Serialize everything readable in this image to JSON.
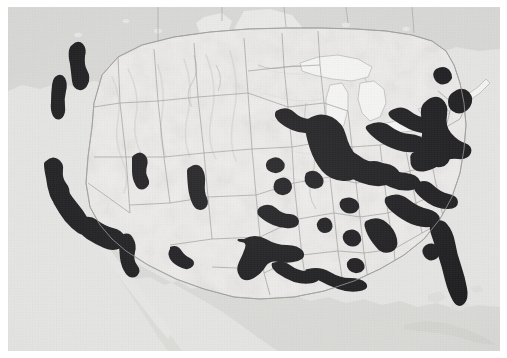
{
  "document": {
    "kind": "scanned-map-figure",
    "subject": "United States megaregions / urbanized corridors",
    "title_visible": "",
    "caption_visible": "",
    "legend_visible": "",
    "has_text_labels": false,
    "orientation": "landscape",
    "projection_appearance": "conic (Albers-like), curved parallels"
  },
  "canvas": {
    "width_px": 507,
    "height_px": 358,
    "paper_margin_px": 8,
    "map_left_px": 8,
    "map_top_px": 7,
    "map_width_px": 492,
    "map_height_px": 344
  },
  "palette": {
    "paper_white": "#ffffff",
    "us_land_fill": "#edecea",
    "foreign_land_fill": "#d6d6d3",
    "ocean_fill": "#e4e4e2",
    "lake_fill": "#f4f4f2",
    "state_border": "#8d8d8a",
    "country_border": "#6f6f6c",
    "coastline": "#9a9a97",
    "corridor_fill": "#17171a",
    "relief_shadow": "#dcdcd9"
  },
  "map_layers": [
    {
      "name": "ocean",
      "label": "Ocean / water background",
      "fill": "#e4e4e2"
    },
    {
      "name": "foreign-land",
      "label": "Canada and Mexico",
      "fill": "#d6d6d3"
    },
    {
      "name": "us-land",
      "label": "United States land",
      "fill": "#edecea"
    },
    {
      "name": "great-lakes",
      "label": "Great Lakes",
      "fill": "#f4f4f2"
    },
    {
      "name": "state-boundaries",
      "label": "State boundaries",
      "fill": "#8d8d8a"
    },
    {
      "name": "urban-corridors",
      "label": "Urbanized megaregion corridors",
      "fill": "#17171a"
    }
  ],
  "corridors": [
    {
      "id": "cascadia-puget",
      "label": "Puget Sound / Seattle corridor"
    },
    {
      "id": "willamette",
      "label": "Willamette Valley / Portland corridor"
    },
    {
      "id": "norcal-bay",
      "label": "San Francisco Bay Area"
    },
    {
      "id": "central-valley",
      "label": "California Central Valley"
    },
    {
      "id": "socal",
      "label": "Southern California / Los Angeles - San Diego"
    },
    {
      "id": "wasatch-front",
      "label": "Wasatch Front / Salt Lake City"
    },
    {
      "id": "front-range",
      "label": "Front Range / Denver - Colorado Springs"
    },
    {
      "id": "sun-corridor",
      "label": "Arizona Sun Corridor / Phoenix - Tucson"
    },
    {
      "id": "el-paso",
      "label": "El Paso - Las Cruces"
    },
    {
      "id": "kansas-city",
      "label": "Kansas City"
    },
    {
      "id": "omaha-lincoln",
      "label": "Omaha - Lincoln"
    },
    {
      "id": "oklahoma",
      "label": "Oklahoma City - Tulsa"
    },
    {
      "id": "texas-triangle",
      "label": "Texas Triangle / Dallas - Austin - San Antonio - Houston"
    },
    {
      "id": "gulf-coast",
      "label": "Gulf Coast / New Orleans - Mobile"
    },
    {
      "id": "memphis",
      "label": "Memphis"
    },
    {
      "id": "nashville",
      "label": "Nashville"
    },
    {
      "id": "st-louis",
      "label": "St. Louis"
    },
    {
      "id": "great-lakes-chicago",
      "label": "Chicago / Great Lakes core"
    },
    {
      "id": "twin-cities",
      "label": "Minneapolis - St. Paul"
    },
    {
      "id": "detroit-cleveland",
      "label": "Detroit - Toledo - Cleveland"
    },
    {
      "id": "ohio-valley",
      "label": "Cincinnati - Columbus - Louisville"
    },
    {
      "id": "pittsburgh",
      "label": "Pittsburgh"
    },
    {
      "id": "piedmont-atlantic",
      "label": "Piedmont Atlantic / Atlanta - Charlotte - Raleigh"
    },
    {
      "id": "birmingham",
      "label": "Birmingham"
    },
    {
      "id": "carolina-coast",
      "label": "Carolina coastal corridor"
    },
    {
      "id": "northeast",
      "label": "Northeast megalopolis / Washington - Boston"
    },
    {
      "id": "upstate-ny",
      "label": "Upstate New York / Albany - Syracuse - Buffalo"
    },
    {
      "id": "montreal-edge",
      "label": "Montreal edge"
    },
    {
      "id": "florida",
      "label": "Florida corridor / Tampa - Orlando - Miami"
    }
  ],
  "chart_data": {
    "type": "map",
    "title": "",
    "region": "Contiguous United States",
    "encoding": "binary choropleth (black = urbanized megaregion corridor)",
    "classes": [
      {
        "label": "Urbanized corridor",
        "color": "#17171a"
      },
      {
        "label": "Other United States land",
        "color": "#edecea"
      },
      {
        "label": "Outside study area (Canada / Mexico)",
        "color": "#d6d6d3"
      },
      {
        "label": "Water",
        "color": "#e4e4e2"
      }
    ]
  }
}
